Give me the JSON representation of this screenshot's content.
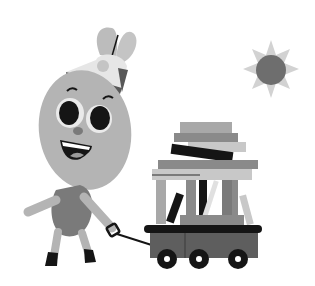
{
  "scene": {
    "description": "Grayscale cartoon of a smiling character wearing a cap, pulling a wagon loaded with books, with a sun in the sky",
    "colors": {
      "background": "#ffffff",
      "body": "#b4b4b4",
      "shirt": "#7a7a7a",
      "dark": "#151515",
      "sun_core": "#6e6e6e",
      "sun_rays": "#d2d2d2",
      "wagon": "#5e5e5e"
    }
  }
}
